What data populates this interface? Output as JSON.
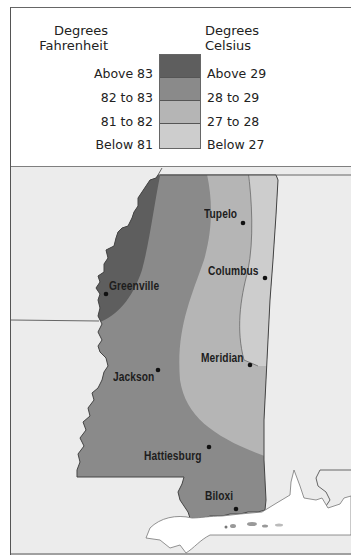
{
  "legend": {
    "fahrenheit_header": [
      "Degrees",
      "Fahrenheit"
    ],
    "celsius_header": [
      "Degrees",
      "Celsius"
    ],
    "classes": [
      {
        "fahrenheit": "Above 83",
        "celsius": "Above 29",
        "color": "#5e5e5e"
      },
      {
        "fahrenheit": "82 to 83",
        "celsius": "28 to 29",
        "color": "#8a8a8a"
      },
      {
        "fahrenheit": "81 to 82",
        "celsius": "27 to 28",
        "color": "#b5b5b5"
      },
      {
        "fahrenheit": "Below 81",
        "celsius": "Below 27",
        "color": "#cdcdcd"
      }
    ]
  },
  "map": {
    "region": "Mississippi",
    "background_color": "#eeeeee",
    "water_color": "#ffffff",
    "cities": [
      {
        "name": "Tupelo",
        "label": "Tupelo"
      },
      {
        "name": "Columbus",
        "label": "Columbus"
      },
      {
        "name": "Greenville",
        "label": "Greenville"
      },
      {
        "name": "Meridian",
        "label": "Meridian"
      },
      {
        "name": "Jackson",
        "label": "Jackson"
      },
      {
        "name": "Hattiesburg",
        "label": "Hattiesburg"
      },
      {
        "name": "Biloxi",
        "label": "Biloxi"
      }
    ]
  }
}
